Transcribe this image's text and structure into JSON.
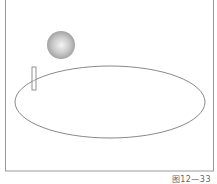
{
  "figure": {
    "caption": "图12—33",
    "frame": {
      "x": 5,
      "y": 0,
      "width": 208,
      "height": 171,
      "stroke": "#9a9a9a"
    },
    "ball": {
      "cx": 61,
      "cy": 45,
      "r": 14,
      "highlight": "#f4f4f4",
      "shade": "#9a9a9a"
    },
    "ellipse_track": {
      "cx": 110,
      "cy": 102,
      "rx": 95,
      "ry": 36,
      "stroke": "#6a6a6a"
    },
    "rectangle_marker": {
      "x": 32,
      "y": 67,
      "width": 4,
      "height": 23,
      "stroke": "#777777"
    }
  }
}
